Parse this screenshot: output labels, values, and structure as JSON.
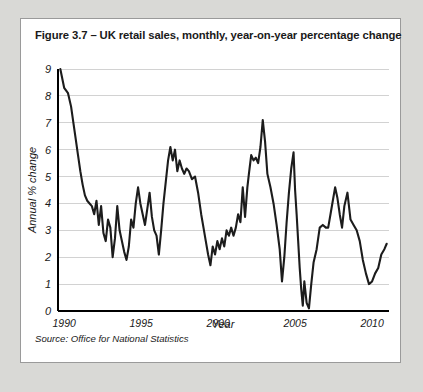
{
  "figure": {
    "title": "Figure 3.7 – UK retail sales, monthly, year-on-year percentage change",
    "source": "Source: Office for National Statistics"
  },
  "chart_data": {
    "type": "line",
    "title": "Figure 3.7 – UK retail sales, monthly, year-on-year percentage change",
    "xlabel": "Year",
    "ylabel": "Annual % change",
    "xlim": [
      1989.6,
      2011.1
    ],
    "ylim": [
      0,
      9
    ],
    "xticks": [
      1990,
      1995,
      2000,
      2005,
      2010
    ],
    "xtick_labels": [
      "1990",
      "1995",
      "2000",
      "2005",
      "2010"
    ],
    "yticks": [
      0,
      1,
      2,
      3,
      4,
      5,
      6,
      7,
      8,
      9
    ],
    "ytick_labels": [
      "0",
      "1",
      "2",
      "3",
      "4",
      "5",
      "6",
      "7",
      "8",
      "9"
    ],
    "grid": "horizontal",
    "legend": "none",
    "line_color": "#1c1c1c",
    "series": [
      {
        "name": "UK retail sales annual % change",
        "x": [
          1989.75,
          1990.0,
          1990.25,
          1990.45,
          1990.6,
          1990.75,
          1990.9,
          1991.05,
          1991.2,
          1991.35,
          1991.5,
          1991.65,
          1991.8,
          1991.95,
          1992.1,
          1992.25,
          1992.4,
          1992.55,
          1992.7,
          1992.85,
          1993.0,
          1993.15,
          1993.3,
          1993.45,
          1993.6,
          1993.75,
          1993.9,
          1994.05,
          1994.2,
          1994.35,
          1994.5,
          1994.65,
          1994.8,
          1994.95,
          1995.1,
          1995.25,
          1995.4,
          1995.55,
          1995.7,
          1995.85,
          1996.0,
          1996.15,
          1996.3,
          1996.45,
          1996.6,
          1996.75,
          1996.9,
          1997.05,
          1997.2,
          1997.35,
          1997.5,
          1997.65,
          1997.8,
          1997.95,
          1998.1,
          1998.3,
          1998.5,
          1998.7,
          1998.9,
          1999.05,
          1999.2,
          1999.35,
          1999.5,
          1999.65,
          1999.8,
          1999.95,
          2000.1,
          2000.25,
          2000.4,
          2000.55,
          2000.7,
          2000.85,
          2001.0,
          2001.15,
          2001.3,
          2001.45,
          2001.6,
          2001.75,
          2001.9,
          2002.0,
          2002.15,
          2002.3,
          2002.45,
          2002.6,
          2002.75,
          2002.9,
          2003.05,
          2003.2,
          2003.4,
          2003.6,
          2003.8,
          2004.0,
          2004.15,
          2004.3,
          2004.45,
          2004.6,
          2004.75,
          2004.9,
          2005.0,
          2005.1,
          2005.2,
          2005.3,
          2005.4,
          2005.5,
          2005.6,
          2005.75,
          2005.9,
          2006.05,
          2006.2,
          2006.4,
          2006.6,
          2006.8,
          2007.0,
          2007.15,
          2007.3,
          2007.45,
          2007.6,
          2007.75,
          2007.9,
          2008.05,
          2008.2,
          2008.4,
          2008.6,
          2008.8,
          2009.0,
          2009.2,
          2009.4,
          2009.6,
          2009.8,
          2010.0,
          2010.2,
          2010.4,
          2010.6,
          2010.8,
          2010.95
        ],
        "values": [
          9.0,
          8.3,
          8.1,
          7.6,
          7.0,
          6.4,
          5.8,
          5.2,
          4.7,
          4.3,
          4.1,
          4.0,
          3.9,
          3.6,
          4.1,
          3.2,
          3.9,
          2.9,
          2.6,
          3.4,
          3.1,
          2.0,
          2.7,
          3.9,
          3.0,
          2.6,
          2.2,
          1.9,
          2.4,
          3.4,
          3.1,
          4.0,
          4.6,
          4.0,
          3.6,
          3.2,
          3.8,
          4.4,
          3.5,
          3.0,
          2.8,
          2.1,
          3.0,
          4.0,
          4.8,
          5.6,
          6.1,
          5.6,
          6.0,
          5.2,
          5.6,
          5.3,
          5.1,
          5.3,
          5.2,
          4.9,
          5.0,
          4.4,
          3.6,
          3.1,
          2.6,
          2.1,
          1.7,
          2.4,
          2.1,
          2.6,
          2.3,
          2.7,
          2.4,
          3.0,
          2.8,
          3.1,
          2.8,
          3.1,
          3.6,
          3.3,
          4.6,
          3.5,
          4.6,
          5.1,
          5.8,
          5.6,
          5.7,
          5.5,
          6.1,
          7.1,
          6.3,
          5.1,
          4.6,
          4.0,
          3.2,
          2.3,
          1.1,
          2.0,
          3.3,
          4.4,
          5.3,
          5.9,
          4.5,
          3.6,
          2.6,
          1.6,
          0.8,
          0.2,
          1.1,
          0.3,
          0.1,
          1.0,
          1.8,
          2.3,
          3.1,
          3.2,
          3.1,
          3.1,
          3.6,
          4.1,
          4.6,
          4.2,
          3.6,
          3.1,
          3.9,
          4.4,
          3.4,
          3.2,
          3.0,
          2.6,
          1.9,
          1.4,
          1.0,
          1.1,
          1.4,
          1.6,
          2.1,
          2.3,
          2.5
        ]
      }
    ]
  }
}
